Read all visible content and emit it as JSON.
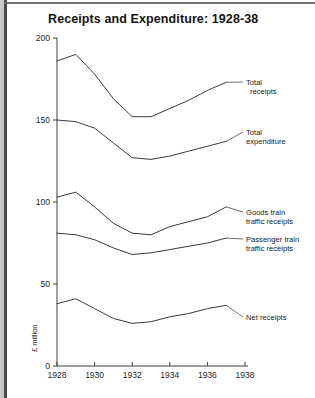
{
  "chart_data": {
    "type": "line",
    "title": "Receipts and Expenditure: 1928-38",
    "xlabel": "",
    "ylabel": "£ million",
    "xlim": [
      1928,
      1938
    ],
    "ylim": [
      0,
      200
    ],
    "grid": false,
    "legend_position": "right-inline-labels",
    "x": [
      1928,
      1929,
      1930,
      1931,
      1932,
      1933,
      1934,
      1935,
      1936,
      1937
    ],
    "x_ticks": [
      "1928",
      "1930",
      "1932",
      "1934",
      "1936",
      "1938"
    ],
    "x_tick_values": [
      1928,
      1930,
      1932,
      1934,
      1936,
      1938
    ],
    "y_ticks": [
      "0",
      "50",
      "100",
      "150",
      "200"
    ],
    "y_tick_values": [
      0,
      50,
      100,
      150,
      200
    ],
    "series": [
      {
        "name": "Total receipts",
        "label_line1": "Total",
        "label_line2": "receipts",
        "values": [
          186,
          190,
          178,
          163,
          152,
          152,
          157,
          162,
          168,
          173
        ]
      },
      {
        "name": "Total expenditure",
        "label_line1": "Total",
        "label_line2": "expenditure",
        "values": [
          150,
          149,
          145,
          136,
          127,
          126,
          128,
          131,
          134,
          137
        ]
      },
      {
        "name": "Goods train traffic receipts",
        "label_line1": "Goods train",
        "label_line2": "traffic receipts",
        "values": [
          103,
          106,
          97,
          87,
          81,
          80,
          85,
          88,
          91,
          97
        ]
      },
      {
        "name": "Passenger train traffic receipts",
        "label_line1": "Passenger train",
        "label_line2": "traffic receipts",
        "values": [
          81,
          80,
          77,
          72,
          68,
          69,
          71,
          73,
          75,
          78
        ]
      },
      {
        "name": "Net receipts",
        "label_line1": "Net receipts",
        "label_line2": "",
        "values": [
          38,
          41,
          35,
          29,
          26,
          27,
          30,
          32,
          35,
          37
        ]
      }
    ]
  }
}
